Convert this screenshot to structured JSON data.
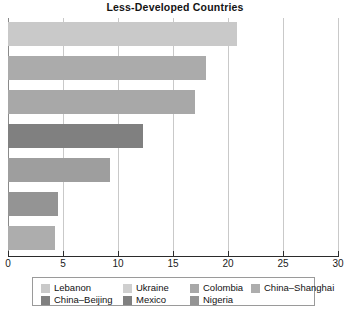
{
  "chart_data": {
    "type": "bar",
    "orientation": "horizontal",
    "title": "Less-Developed Countries",
    "xlabel": "",
    "ylabel": "",
    "xlim": [
      0,
      30
    ],
    "xticks": [
      0,
      5,
      10,
      15,
      20,
      25,
      30
    ],
    "grid": true,
    "grid_axis": "x",
    "legend_position": "bottom",
    "categories": [
      "Lebanon",
      "Ukraine",
      "Colombia",
      "China–Beijing",
      "Mexico",
      "Nigeria",
      "China–Shanghai"
    ],
    "values": [
      20.8,
      18.0,
      17.0,
      12.3,
      9.3,
      4.5,
      4.3
    ],
    "bar_colors": [
      "#c9c9c9",
      "#ababab",
      "#a8a8a8",
      "#808080",
      "#9e9e9e",
      "#949494",
      "#adadad"
    ],
    "series": [
      {
        "name": "Lebanon",
        "value": 20.8,
        "color": "#c9c9c9"
      },
      {
        "name": "Ukraine",
        "value": 18.0,
        "color": "#ababab"
      },
      {
        "name": "Colombia",
        "value": 17.0,
        "color": "#a8a8a8"
      },
      {
        "name": "China–Beijing",
        "value": 12.3,
        "color": "#808080"
      },
      {
        "name": "Mexico",
        "value": 9.3,
        "color": "#9e9e9e"
      },
      {
        "name": "Nigeria",
        "value": 4.5,
        "color": "#949494"
      },
      {
        "name": "China–Shanghai",
        "value": 4.3,
        "color": "#adadad"
      }
    ]
  },
  "axis": {
    "tick_labels": [
      "0",
      "5",
      "10",
      "15",
      "20",
      "25",
      "30"
    ]
  },
  "legend": {
    "row1": [
      {
        "label": "Lebanon",
        "color": "#c9c9c9"
      },
      {
        "label": "Ukraine",
        "color": "#cfcfcf"
      },
      {
        "label": "Colombia",
        "color": "#a8a8a8"
      },
      {
        "label": "China–Shanghai",
        "color": "#adadad"
      }
    ],
    "row2": [
      {
        "label": "China–Beijing",
        "color": "#808080"
      },
      {
        "label": "Mexico",
        "color": "#808080"
      },
      {
        "label": "Nigeria",
        "color": "#949494"
      }
    ]
  }
}
